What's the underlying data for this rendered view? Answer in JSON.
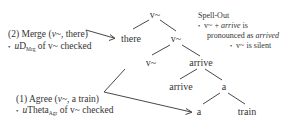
{
  "tree": {
    "nodes": [
      {
        "id": "root",
        "label": "v~"
      },
      {
        "id": "spec",
        "label": "there"
      },
      {
        "id": "vbar",
        "label": "v~"
      },
      {
        "id": "vhead",
        "label": "v~"
      },
      {
        "id": "vp",
        "label": "arrive"
      },
      {
        "id": "vhead2",
        "label": "arrive"
      },
      {
        "id": "dp",
        "label": "a"
      },
      {
        "id": "det",
        "label": "a"
      },
      {
        "id": "noun",
        "label": "train"
      }
    ]
  },
  "annotations": {
    "merge": {
      "title": "(2) Merge (",
      "title_italic": "v~",
      "title_rest": ", there)",
      "bullet_prefix": "u",
      "bullet_feature": "D",
      "bullet_sub": "Mrg",
      "bullet_rest": " of v~ checked"
    },
    "agree": {
      "title": "(1) Agree (",
      "title_italic": "v~",
      "title_rest": ", a train)",
      "bullet_prefix": "u",
      "bullet_feature": "Theta",
      "bullet_sub": "Agr",
      "bullet_rest": " of v~ checked"
    },
    "spellout": {
      "title": "Spell-Out",
      "line1_pre": "v~ + ",
      "line1_italic": "arrive",
      "line1_post": " is",
      "line2_pre": "pronounced as ",
      "line2_italic": "arrived",
      "line3": "v~ is silent"
    },
    "bullet": "•"
  }
}
